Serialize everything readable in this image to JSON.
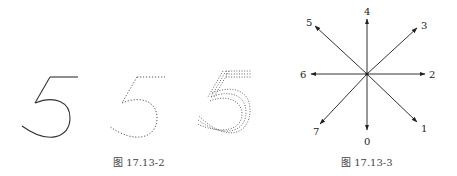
{
  "figures": [
    {
      "id": "fig-17-13-2",
      "caption": "图 17.13-2",
      "items": [
        {
          "glyph": "5",
          "style": "solid stroke"
        },
        {
          "glyph": "5",
          "style": "single dotted stroke"
        },
        {
          "glyph": "5",
          "style": "multiple dotted strokes"
        }
      ]
    },
    {
      "id": "fig-17-13-3",
      "caption": "图 17.13-3",
      "directions": [
        {
          "label": "0",
          "dir": "down"
        },
        {
          "label": "1",
          "dir": "down-right"
        },
        {
          "label": "2",
          "dir": "right"
        },
        {
          "label": "3",
          "dir": "up-right"
        },
        {
          "label": "4",
          "dir": "up"
        },
        {
          "label": "5",
          "dir": "up-left"
        },
        {
          "label": "6",
          "dir": "left"
        },
        {
          "label": "7",
          "dir": "down-left"
        }
      ]
    }
  ],
  "colors": {
    "stroke": "#333333",
    "dots": "#555555",
    "background": "#ffffff"
  }
}
